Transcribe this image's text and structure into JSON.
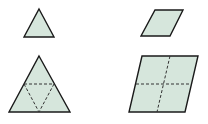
{
  "diagram": {
    "colors": {
      "fill": "#d6e6dc",
      "stroke": "#1a1a1a",
      "dash": "#333333",
      "background": "#ffffff"
    },
    "shapes": [
      {
        "id": "small-triangle",
        "type": "triangle",
        "points": "39,9 54,37 24,37"
      },
      {
        "id": "large-triangle",
        "type": "triangle",
        "points": "39,56 70,112 9,112",
        "dashed_lines": [
          "24,84 54,84",
          "24,84 39,112",
          "54,84 39,112"
        ]
      },
      {
        "id": "small-parallelogram",
        "type": "parallelogram",
        "points": "155,10 183,10 170,36 141,36"
      },
      {
        "id": "large-parallelogram",
        "type": "parallelogram",
        "points": "142,56 198,56 185,112 129,112",
        "dashed_lines": [
          "136,84 191,84",
          "170,56 157,112"
        ]
      }
    ]
  }
}
